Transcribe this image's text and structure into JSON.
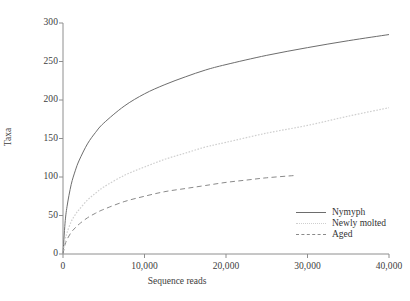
{
  "chart_data": {
    "type": "line",
    "title": "",
    "subtitle": "",
    "xlabel": "Sequence reads",
    "ylabel": "Taxa",
    "xlim": [
      0,
      40000
    ],
    "ylim": [
      0,
      300
    ],
    "grid": false,
    "legend_position": "bottom-right",
    "xticks": [
      0,
      10000,
      20000,
      30000,
      40000
    ],
    "xtick_labels": [
      "0",
      "10,000",
      "20,000",
      "30,000",
      "40,000"
    ],
    "yticks": [
      0,
      50,
      100,
      150,
      200,
      250,
      300
    ],
    "ytick_labels": [
      "0",
      "50",
      "100",
      "150",
      "200",
      "250",
      "300"
    ],
    "series": [
      {
        "name": "Nymyph",
        "style": "solid",
        "color": "#6d6d6d",
        "x": [
          0,
          250,
          500,
          1000,
          1500,
          2000,
          3000,
          4000,
          5000,
          7500,
          10000,
          12500,
          15000,
          17500,
          20000,
          25000,
          30000,
          35000,
          40000
        ],
        "values": [
          0,
          40,
          62,
          90,
          108,
          122,
          143,
          158,
          170,
          192,
          208,
          220,
          230,
          239,
          246,
          258,
          268,
          277,
          285
        ]
      },
      {
        "name": "Newly molted",
        "style": "dotted",
        "color": "#cfcfcf",
        "x": [
          0,
          250,
          500,
          1000,
          1500,
          2000,
          3000,
          4000,
          5000,
          7500,
          10000,
          12500,
          15000,
          17500,
          20000,
          25000,
          30000,
          35000,
          40000
        ],
        "values": [
          0,
          18,
          28,
          42,
          51,
          58,
          70,
          79,
          87,
          102,
          113,
          123,
          131,
          139,
          145,
          157,
          167,
          179,
          190
        ]
      },
      {
        "name": "Aged",
        "style": "dashed",
        "color": "#8a8a8a",
        "x": [
          0,
          250,
          500,
          1000,
          1500,
          2000,
          3000,
          4000,
          5000,
          7500,
          10000,
          12500,
          15000,
          17500,
          20000,
          22500,
          25000,
          28500
        ],
        "values": [
          0,
          12,
          19,
          28,
          34,
          39,
          47,
          53,
          58,
          68,
          75,
          81,
          85,
          89,
          93,
          96,
          99,
          102
        ]
      }
    ]
  },
  "axes": {
    "y_title": "Taxa",
    "x_title": "Sequence reads",
    "ytick_labels": [
      "300",
      "250",
      "200",
      "150",
      "100",
      "50",
      "0"
    ],
    "xtick_labels": [
      "0",
      "10,000",
      "20,000",
      "30,000",
      "40,000"
    ]
  },
  "legend": {
    "items": [
      {
        "label": "Nymyph",
        "style": "solid"
      },
      {
        "label": "Newly molted",
        "style": "dotted"
      },
      {
        "label": "Aged",
        "style": "dashed"
      }
    ]
  }
}
